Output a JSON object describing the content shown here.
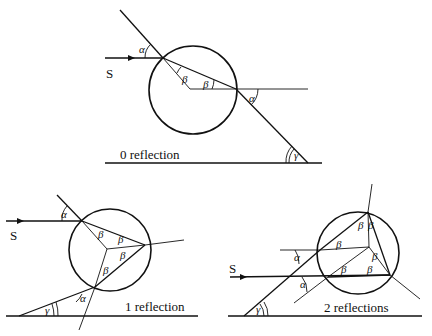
{
  "diagrams": [
    {
      "caption": "0 reflection",
      "source_label": "S",
      "angles": {
        "alpha_in": "α",
        "beta_1": "β",
        "beta_2": "β",
        "alpha_out": "α",
        "gamma": "γ"
      }
    },
    {
      "caption": "1 reflection",
      "source_label": "S",
      "angles": {
        "alpha_in": "α",
        "beta_1": "β",
        "beta_2": "β",
        "beta_3": "β",
        "beta_4": "β",
        "alpha_out": "α",
        "gamma": "γ"
      }
    },
    {
      "caption": "2 reflections",
      "source_label": "S",
      "angles": {
        "alpha_in": "α",
        "beta_1": "β",
        "beta_2": "β",
        "beta_3": "β",
        "beta_4": "β",
        "beta_5": "β",
        "beta_6": "β",
        "alpha_out": "α",
        "gamma": "γ"
      }
    }
  ]
}
